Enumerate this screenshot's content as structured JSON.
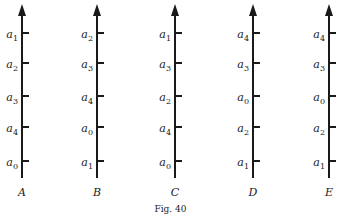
{
  "figure": {
    "caption": "Fig. 40",
    "tick_y": [
      33,
      63,
      96,
      127,
      161
    ],
    "axes": [
      {
        "name": "A",
        "x": 22,
        "labels_top_to_bottom": [
          "1",
          "2",
          "3",
          "4",
          "0"
        ]
      },
      {
        "name": "B",
        "x": 97,
        "labels_top_to_bottom": [
          "2",
          "3",
          "4",
          "0",
          "1"
        ]
      },
      {
        "name": "C",
        "x": 175,
        "labels_top_to_bottom": [
          "1",
          "3",
          "2",
          "4",
          "0"
        ]
      },
      {
        "name": "D",
        "x": 253,
        "labels_top_to_bottom": [
          "4",
          "3",
          "0",
          "2",
          "1"
        ]
      },
      {
        "name": "E",
        "x": 329,
        "labels_top_to_bottom": [
          "4",
          "3",
          "0",
          "2",
          "1"
        ]
      }
    ],
    "label_letter": "a"
  }
}
